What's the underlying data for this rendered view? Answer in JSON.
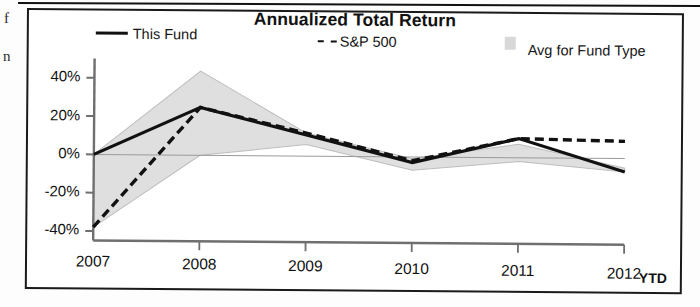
{
  "artifacts": {
    "left_fragment_1": "f",
    "left_fragment_2": "n"
  },
  "chart_data": {
    "type": "line",
    "title": "Annualized Total Return",
    "xlabel": "",
    "ylabel": "",
    "x": [
      "2007",
      "2008",
      "2009",
      "2010",
      "2011",
      "2012"
    ],
    "categories": [
      "2007",
      "2008",
      "2009",
      "2010",
      "2011",
      "2012"
    ],
    "ylim": [
      -45,
      48
    ],
    "yticks": [
      -40,
      -20,
      0,
      20,
      40
    ],
    "ytick_labels": [
      "-40%",
      "-20%",
      "0%",
      "20%",
      "40%"
    ],
    "xtick_labels": [
      "2007",
      "2008",
      "2009",
      "2010",
      "2011",
      "2012"
    ],
    "x_suffix_label": "YTD",
    "grid": false,
    "legend_position": "top",
    "series": [
      {
        "name": "This Fund",
        "style": "solid",
        "color": "#111111",
        "values": [
          0,
          25,
          11,
          -3,
          10,
          -7
        ]
      },
      {
        "name": "S&P 500",
        "style": "dashed",
        "color": "#111111",
        "values": [
          -38,
          25,
          12,
          -2,
          10,
          9
        ]
      },
      {
        "name": "Avg for Fund Type",
        "style": "band",
        "color": "#d8d8d8",
        "upper": [
          0,
          44,
          12,
          -1,
          7,
          -5
        ],
        "lower": [
          -38,
          0,
          6,
          -7,
          -2,
          -7
        ]
      }
    ],
    "legend": [
      {
        "label": "This Fund",
        "marker": "solid-line"
      },
      {
        "label": "S&P 500",
        "marker": "dashed-line"
      },
      {
        "label": "Avg for Fund Type",
        "marker": "gray-swatch"
      }
    ],
    "colors": {
      "line": "#111111",
      "band": "#dddddd",
      "band_edge": "#bdbdbd",
      "axis": "#6f6f6f",
      "frame": "#1a1a1a",
      "text": "#111111"
    }
  }
}
